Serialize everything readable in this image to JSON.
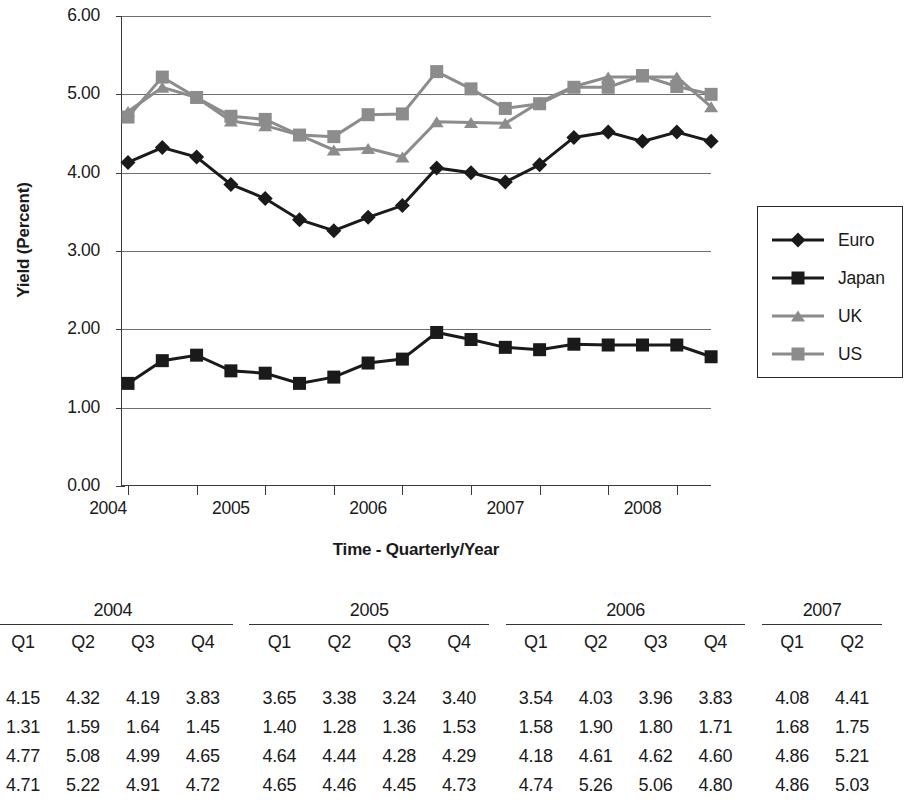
{
  "chart_data": {
    "type": "line",
    "title": "",
    "xlabel": "Time - Quarterly/Year",
    "ylabel": "Yield (Percent)",
    "ylim": [
      0.0,
      6.0
    ],
    "ytick_labels": [
      "0.00",
      "1.00",
      "2.00",
      "3.00",
      "4.00",
      "5.00",
      "6.00"
    ],
    "ytick_values": [
      0.0,
      1.0,
      2.0,
      3.0,
      4.0,
      5.0,
      6.0
    ],
    "grid": "horizontal",
    "legend_position": "right",
    "x_axis_year_labels": [
      "2004",
      "2005",
      "2006",
      "2007",
      "2008"
    ],
    "x": [
      "2004 Q2",
      "2004 Q3",
      "2004 Q4",
      "2005 Q1",
      "2005 Q2",
      "2005 Q3",
      "2005 Q4",
      "2006 Q1",
      "2006 Q2",
      "2006 Q3",
      "2006 Q4",
      "2007 Q1",
      "2007 Q2",
      "2007 Q3",
      "2007 Q4",
      "2008 Q1",
      "2008 Q2",
      "2008 Q3"
    ],
    "series": [
      {
        "name": "Euro",
        "marker": "diamond",
        "color": "#1a1a1a",
        "values": [
          4.13,
          4.32,
          4.2,
          3.85,
          3.67,
          3.4,
          3.26,
          3.43,
          3.58,
          4.06,
          4.0,
          3.88,
          4.1,
          4.45,
          4.52,
          4.4,
          4.52,
          4.4
        ]
      },
      {
        "name": "Japan",
        "marker": "square",
        "color": "#1a1a1a",
        "values": [
          1.31,
          1.6,
          1.67,
          1.47,
          1.44,
          1.31,
          1.39,
          1.57,
          1.62,
          1.96,
          1.87,
          1.77,
          1.74,
          1.81,
          1.8,
          1.8,
          1.8,
          1.65
        ]
      },
      {
        "name": "UK",
        "marker": "triangle",
        "color": "#8c8c8c",
        "values": [
          4.78,
          5.09,
          4.96,
          4.66,
          4.6,
          4.48,
          4.29,
          4.31,
          4.2,
          4.65,
          4.64,
          4.63,
          4.9,
          5.1,
          5.22,
          5.22,
          5.22,
          4.84
        ]
      },
      {
        "name": "US",
        "marker": "square",
        "color": "#8c8c8c",
        "values": [
          4.71,
          5.22,
          4.96,
          4.72,
          4.68,
          4.48,
          4.46,
          4.74,
          4.75,
          5.29,
          5.07,
          4.82,
          4.88,
          5.09,
          5.09,
          5.24,
          5.1,
          5.0
        ]
      }
    ]
  },
  "legend": {
    "items": [
      {
        "label": "Euro",
        "marker": "diamond-marker",
        "color": "#1a1a1a"
      },
      {
        "label": "Japan",
        "marker": "square-marker",
        "color": "#1a1a1a"
      },
      {
        "label": "UK",
        "marker": "triangle-marker",
        "color": "#8c8c8c"
      },
      {
        "label": "US",
        "marker": "square-marker",
        "color": "#8c8c8c"
      }
    ]
  },
  "table": {
    "note_left_cropped": true,
    "note_right_cropped": true,
    "year_groups": [
      "2004",
      "2005",
      "2006",
      "2007"
    ],
    "quarters": [
      "Q1",
      "Q2",
      "Q3",
      "Q4"
    ],
    "quarters_last_group": [
      "Q1",
      "Q2"
    ],
    "rows": [
      {
        "label": "",
        "values_2004": [
          "4.15",
          "4.32",
          "4.19",
          "3.83"
        ],
        "values_2005": [
          "3.65",
          "3.38",
          "3.24",
          "3.40"
        ],
        "values_2006": [
          "3.54",
          "4.03",
          "3.96",
          "3.83"
        ],
        "values_2007": [
          "4.08",
          "4.41"
        ]
      },
      {
        "label": "",
        "values_2004": [
          "1.31",
          "1.59",
          "1.64",
          "1.45"
        ],
        "values_2005": [
          "1.40",
          "1.28",
          "1.36",
          "1.53"
        ],
        "values_2006": [
          "1.58",
          "1.90",
          "1.80",
          "1.71"
        ],
        "values_2007": [
          "1.68",
          "1.75"
        ]
      },
      {
        "label": "",
        "values_2004": [
          "4.77",
          "5.08",
          "4.99",
          "4.65"
        ],
        "values_2005": [
          "4.64",
          "4.44",
          "4.28",
          "4.29"
        ],
        "values_2006": [
          "4.18",
          "4.61",
          "4.62",
          "4.60"
        ],
        "values_2007": [
          "4.86",
          "5.21"
        ]
      },
      {
        "label": "",
        "values_2004": [
          "4.71",
          "5.22",
          "4.91",
          "4.72"
        ],
        "values_2005": [
          "4.65",
          "4.46",
          "4.45",
          "4.73"
        ],
        "values_2006": [
          "4.74",
          "5.26",
          "5.06",
          "4.80"
        ],
        "values_2007": [
          "4.86",
          "5.03"
        ]
      }
    ]
  }
}
